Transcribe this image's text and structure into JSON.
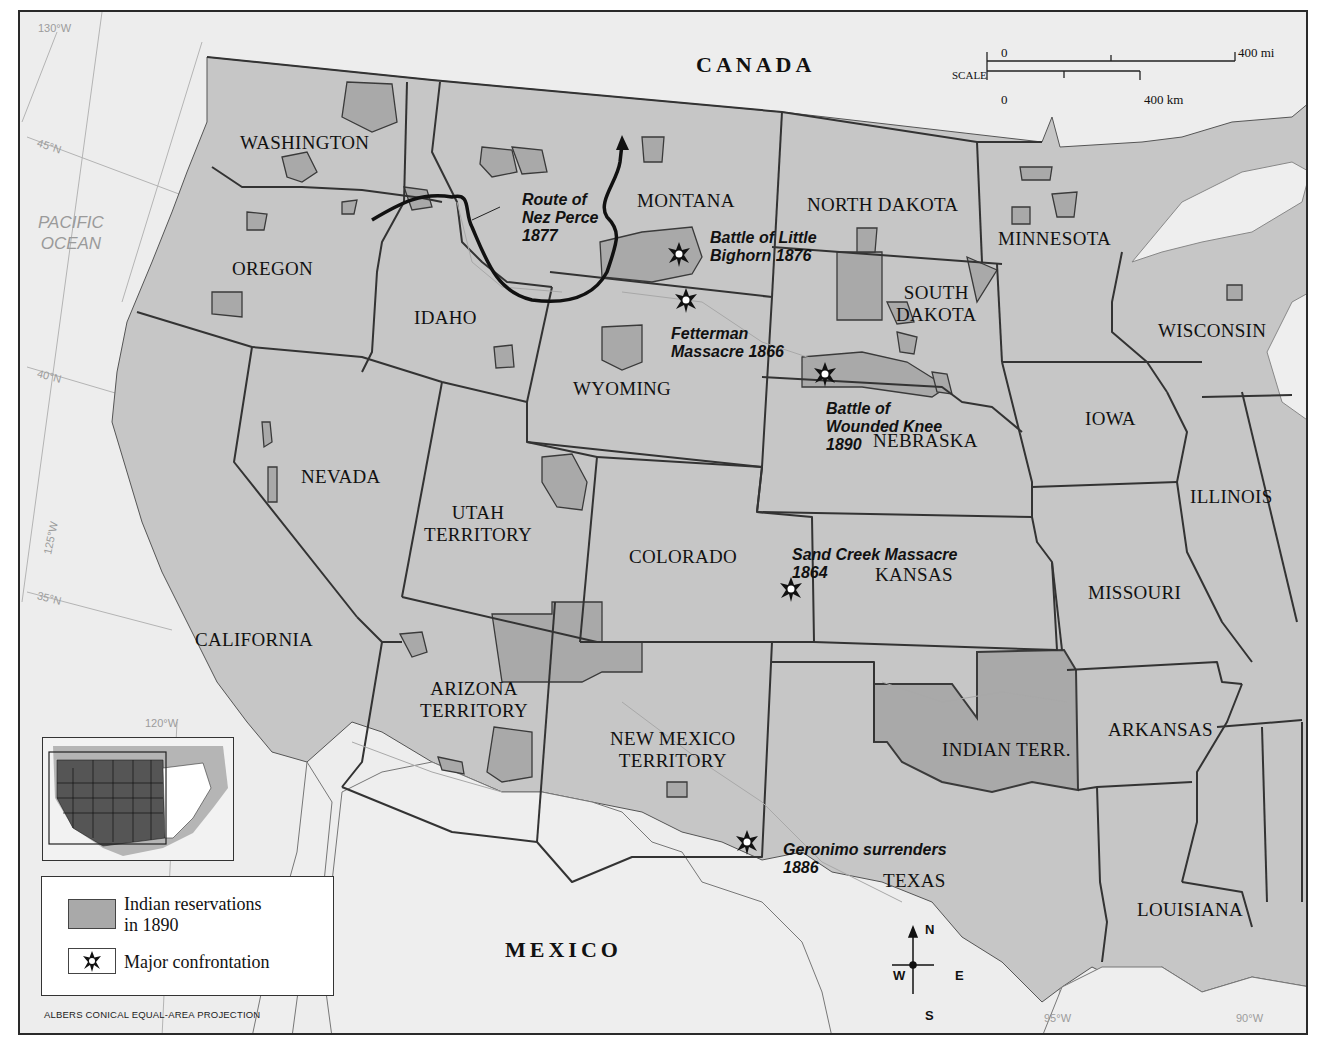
{
  "map": {
    "projection": "ALBERS CONICAL EQUAL-AREA PROJECTION",
    "colors": {
      "reservation_fill": "#a9a9a9",
      "land_fill": "#c6c6c6",
      "water_fill": "#ededed",
      "border": "#3a3a3a",
      "route": "#111111"
    },
    "countries": [
      {
        "name": "CANADA"
      },
      {
        "name": "MEXICO"
      }
    ],
    "water_bodies": [
      {
        "name": "PACIFIC\nOCEAN",
        "line1": "PACIFIC",
        "line2": "OCEAN"
      }
    ],
    "states": [
      {
        "name": "WASHINGTON"
      },
      {
        "name": "OREGON"
      },
      {
        "name": "IDAHO"
      },
      {
        "name": "MONTANA"
      },
      {
        "name": "NORTH DAKOTA"
      },
      {
        "name": "SOUTH",
        "line2": "DAKOTA"
      },
      {
        "name": "MINNESOTA"
      },
      {
        "name": "WISCONSIN"
      },
      {
        "name": "WYOMING"
      },
      {
        "name": "NEVADA"
      },
      {
        "name": "UTAH",
        "line2": "TERRITORY"
      },
      {
        "name": "COLORADO"
      },
      {
        "name": "NEBRASKA"
      },
      {
        "name": "IOWA"
      },
      {
        "name": "ILLINOIS"
      },
      {
        "name": "KANSAS"
      },
      {
        "name": "MISSOURI"
      },
      {
        "name": "CALIFORNIA"
      },
      {
        "name": "ARIZONA",
        "line2": "TERRITORY"
      },
      {
        "name": "NEW MEXICO",
        "line2": "TERRITORY"
      },
      {
        "name": "INDIAN TERR."
      },
      {
        "name": "ARKANSAS"
      },
      {
        "name": "TEXAS"
      },
      {
        "name": "LOUISIANA"
      }
    ],
    "events": [
      {
        "line1": "Route of",
        "line2": "Nez Perce",
        "line3": "1877",
        "type": "route"
      },
      {
        "line1": "Battle of Little",
        "line2": "Bighorn 1876",
        "type": "confrontation"
      },
      {
        "line1": "Fetterman",
        "line2": "Massacre 1866",
        "type": "confrontation"
      },
      {
        "line1": "Battle of",
        "line2": "Wounded Knee",
        "line3": "1890",
        "type": "confrontation"
      },
      {
        "line1": "Sand Creek Massacre",
        "line2": "1864",
        "type": "confrontation"
      },
      {
        "line1": "Geronimo surrenders",
        "line2": "1886",
        "type": "confrontation"
      }
    ],
    "graticule": [
      {
        "label": "130°W"
      },
      {
        "label": "45°N"
      },
      {
        "label": "40°N"
      },
      {
        "label": "125°W"
      },
      {
        "label": "35°N"
      },
      {
        "label": "120°W"
      },
      {
        "label": "95°W"
      },
      {
        "label": "90°W"
      }
    ],
    "scale": {
      "label": "SCALE",
      "mi_zero": "0",
      "mi_max": "400 mi",
      "km_zero": "0",
      "km_max": "400 km"
    },
    "compass": {
      "n": "N",
      "s": "S",
      "e": "E",
      "w": "W"
    },
    "legend": {
      "items": [
        {
          "line1": "Indian reservations",
          "line2": "in 1890",
          "icon": "reservation-swatch"
        },
        {
          "line1": "Major confrontation",
          "icon": "star-burst-icon"
        }
      ]
    }
  }
}
